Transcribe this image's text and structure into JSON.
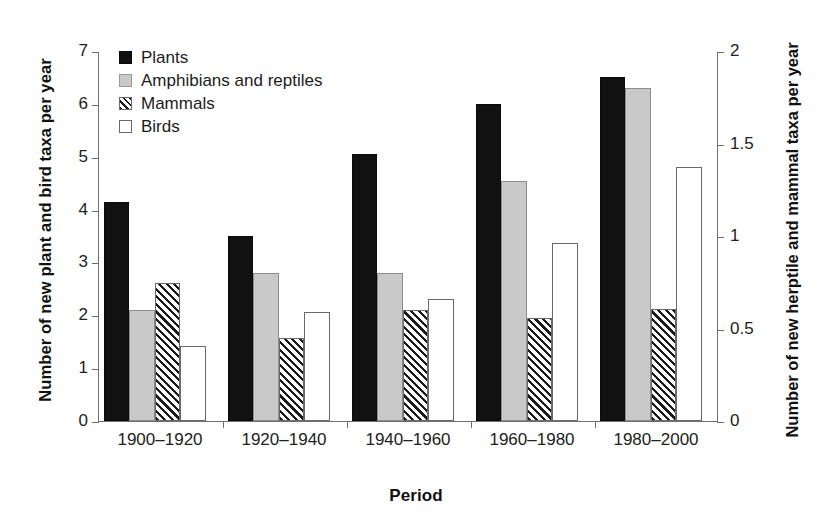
{
  "chart_data": {
    "type": "bar",
    "title": "",
    "xlabel": "Period",
    "ylabel": "Number of new plant and bird taxa per year",
    "ylabel_right": "Number of new herptile and mammal taxa per year",
    "categories": [
      "1900–1920",
      "1920–1940",
      "1940–1960",
      "1960–1980",
      "1980–2000"
    ],
    "series": [
      {
        "name": "Plants",
        "axis": "left",
        "values": [
          4.15,
          3.5,
          5.05,
          6.0,
          6.5
        ],
        "style": "solid-black"
      },
      {
        "name": "Amphibians and reptiles",
        "axis": "right",
        "values": [
          0.6,
          0.8,
          0.8,
          1.3,
          1.8
        ],
        "values_left_scale": [
          2.1,
          2.8,
          2.8,
          4.55,
          6.3
        ],
        "style": "solid-gray"
      },
      {
        "name": "Mammals",
        "axis": "right",
        "values": [
          0.75,
          0.45,
          0.6,
          0.56,
          0.61
        ],
        "values_left_scale": [
          2.62,
          1.58,
          2.1,
          1.95,
          2.12
        ],
        "style": "hatched"
      },
      {
        "name": "Birds",
        "axis": "left",
        "values": [
          1.42,
          2.06,
          2.3,
          3.36,
          4.8
        ],
        "style": "open-white"
      }
    ],
    "ylim": [
      0,
      7
    ],
    "ylim_right": [
      0,
      2
    ],
    "yticks": [
      "0",
      "1",
      "2",
      "3",
      "4",
      "5",
      "6",
      "7"
    ],
    "yticks_right": [
      "0",
      "0.5",
      "1",
      "1.5",
      "2"
    ],
    "grid": false,
    "legend_position": "top-left",
    "colors": {
      "plants": "#111111",
      "amphibians": "#c9c9c9",
      "mammals_hatch": "#1a1a1a",
      "birds": "#ffffff",
      "axis": "#6f6f6f",
      "text": "#1a1a1a"
    }
  },
  "legend": {
    "items": [
      {
        "label": "Plants"
      },
      {
        "label": "Amphibians and reptiles"
      },
      {
        "label": "Mammals"
      },
      {
        "label": "Birds"
      }
    ]
  }
}
